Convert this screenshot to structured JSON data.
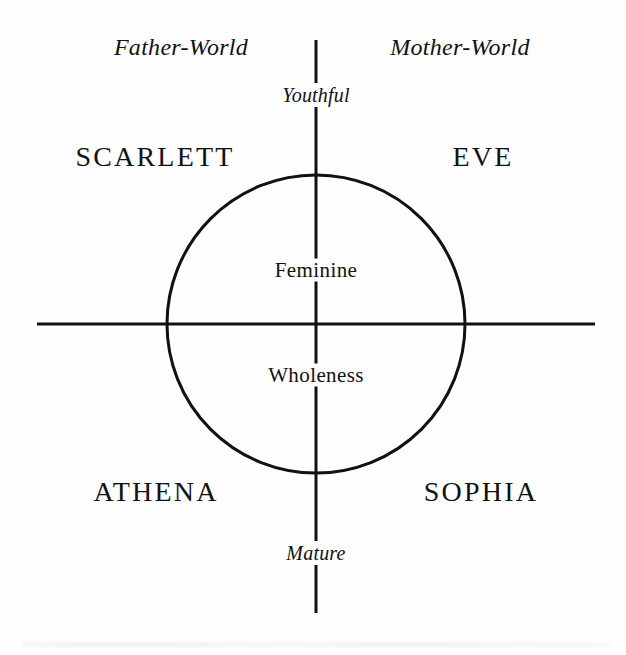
{
  "diagram": {
    "title": "Feminine Wholeness",
    "canvas": {
      "width": 626,
      "height": 655,
      "background": "#fefefe"
    },
    "ink_color": "#111111",
    "axes": {
      "vertical": {
        "x": 316,
        "y1": 40,
        "y2": 613
      },
      "horizontal": {
        "y": 324,
        "x1": 37,
        "x2": 595
      }
    },
    "circle": {
      "cx": 316,
      "cy": 324,
      "r": 149
    },
    "pole_labels": {
      "top": "Youthful",
      "bottom": "Mature"
    },
    "world_labels": {
      "left": "Father-World",
      "right": "Mother-World"
    },
    "center_labels": {
      "upper": "Feminine",
      "lower": "Wholeness"
    },
    "quadrants": [
      {
        "key": "upper-left",
        "archetype": "SCARLETT",
        "world": "Father-World",
        "pole": "Youthful"
      },
      {
        "key": "upper-right",
        "archetype": "EVE",
        "world": "Mother-World",
        "pole": "Youthful"
      },
      {
        "key": "lower-left",
        "archetype": "ATHENA",
        "world": "Father-World",
        "pole": "Mature"
      },
      {
        "key": "lower-right",
        "archetype": "SOPHIA",
        "world": "Mother-World",
        "pole": "Mature"
      }
    ]
  },
  "chart_data": {
    "type": "scatter",
    "title": "Feminine Wholeness",
    "xlabel": "Father-World ↔ Mother-World",
    "ylabel": "Youthful ↔ Mature",
    "xlim": [
      -1,
      1
    ],
    "ylim": [
      -1,
      1
    ],
    "grid": false,
    "legend": "none",
    "axis_tick_labels": {
      "x": [
        "Father-World",
        "Mother-World"
      ],
      "y": [
        "Youthful",
        "Mature"
      ]
    },
    "annotations": [
      "Feminine",
      "Wholeness"
    ],
    "points": [
      {
        "label": "SCARLETT",
        "x": -0.62,
        "y": 0.62
      },
      {
        "label": "EVE",
        "x": 0.62,
        "y": 0.62
      },
      {
        "label": "ATHENA",
        "x": -0.62,
        "y": -0.62
      },
      {
        "label": "SOPHIA",
        "x": 0.62,
        "y": -0.62
      }
    ]
  }
}
